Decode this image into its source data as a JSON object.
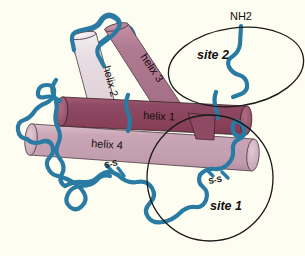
{
  "figure": {
    "background_color": "#fdfdf2",
    "backbone_color": "#2a7ba3",
    "outline_color": "#1a1a1a",
    "text_color": "#14100f"
  },
  "helices": [
    {
      "id": "helix-1",
      "label": "helix 1",
      "color": "#8e4a63",
      "shade_color": "#7d3f56",
      "cap_color": "#a3596f",
      "description": "horizontal dark burgundy cylinder across the middle"
    },
    {
      "id": "helix-2",
      "label": "helix 2",
      "color": "#e8dde2",
      "shade_color": "#d8c9d1",
      "cap_color": "#f2ecef",
      "description": "pale near-white diagonal cylinder upper left"
    },
    {
      "id": "helix-3",
      "label": "helix 3",
      "color": "#b07a92",
      "shade_color": "#9e6a81",
      "cap_color": "#c08fa4",
      "description": "medium mauve diagonal cylinder upper middle"
    },
    {
      "id": "helix-4",
      "label": "helix 4",
      "color": "#c9a5b5",
      "shade_color": "#b994a6",
      "cap_color": "#dbbcc8",
      "description": "dusty pink cylinder lower left to right"
    }
  ],
  "annotations": {
    "terminus": {
      "id": "nh2-terminus",
      "label": "NH2"
    },
    "disulfides": [
      {
        "id": "disulfide-left",
        "label": "S-S"
      },
      {
        "id": "disulfide-right",
        "label": "S-S"
      }
    ],
    "sites": [
      {
        "id": "site-2",
        "label": "site 2",
        "shape": "ellipse"
      },
      {
        "id": "site-1",
        "label": "site 1",
        "shape": "circle"
      }
    ]
  }
}
